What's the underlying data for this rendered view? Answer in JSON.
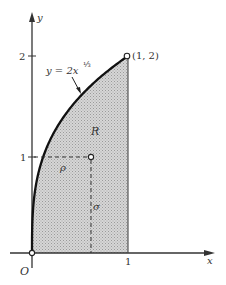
{
  "figure": {
    "type": "function-region",
    "colors": {
      "ink": "#222222",
      "shade": "#c8c8c8",
      "background": "#ffffff"
    },
    "axes": {
      "x_label": "x",
      "y_label": "y",
      "origin_label": "O",
      "x_ticks": [
        {
          "value": 1,
          "label": "1"
        }
      ],
      "y_ticks": [
        {
          "value": 1,
          "label": "1"
        },
        {
          "value": 2,
          "label": "2"
        }
      ]
    },
    "curve": {
      "equation_lhs": "y = 2x",
      "exponent": "⅓",
      "domain": [
        0,
        1
      ]
    },
    "endpoint_label": "(1, 2)",
    "region_label": "R",
    "point": {
      "rho_label": "ρ",
      "sigma_label": "σ"
    }
  }
}
